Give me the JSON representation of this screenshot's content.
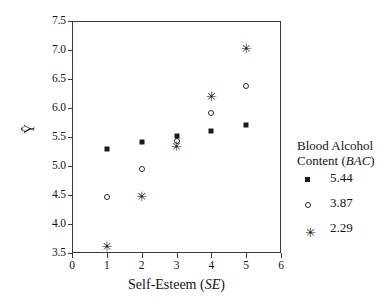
{
  "chart_data": {
    "type": "scatter",
    "title": "",
    "xlabel": "Self-Esteem (SE)",
    "xlabel_plain": "Self-Esteem",
    "xlabel_italic": "SE",
    "ylabel": "Ŷ",
    "xlim": [
      0,
      6
    ],
    "ylim": [
      3.5,
      7.5
    ],
    "xticks": [
      "0",
      "1",
      "2",
      "3",
      "4",
      "5",
      "6"
    ],
    "yticks": [
      "3.5",
      "4.0",
      "4.5",
      "5.0",
      "5.5",
      "6.0",
      "6.5",
      "7.0",
      "7.5"
    ],
    "xtick_values": [
      0,
      1,
      2,
      3,
      4,
      5,
      6
    ],
    "ytick_values": [
      3.5,
      4.0,
      4.5,
      5.0,
      5.5,
      6.0,
      6.5,
      7.0,
      7.5
    ],
    "grid": false,
    "legend_position": "right",
    "x": [
      1,
      2,
      3,
      4,
      5
    ],
    "series": [
      {
        "name": "5.44",
        "marker": "filled-square",
        "values": [
          5.3,
          5.41,
          5.51,
          5.61,
          5.71
        ]
      },
      {
        "name": "3.87",
        "marker": "open-circle",
        "values": [
          4.47,
          4.95,
          5.43,
          5.91,
          6.38
        ]
      },
      {
        "name": "2.29",
        "marker": "asterisk",
        "values": [
          3.62,
          4.49,
          5.35,
          6.21,
          7.04
        ]
      }
    ]
  },
  "legend": {
    "title_line1": "Blood Alcohol",
    "title_line2_plain": "Content (",
    "title_line2_italic": "BAC",
    "title_line2_close": ")",
    "entries": [
      {
        "label": "5.44",
        "marker": "filled-square"
      },
      {
        "label": "3.87",
        "marker": "open-circle"
      },
      {
        "label": "2.29",
        "marker": "asterisk"
      }
    ]
  },
  "colors": {
    "marker": "#1a1a1a",
    "axis": "#3a3a3a",
    "background": "#ffffff",
    "text": "#141414"
  },
  "glyphs": {
    "asterisk": "✳"
  }
}
